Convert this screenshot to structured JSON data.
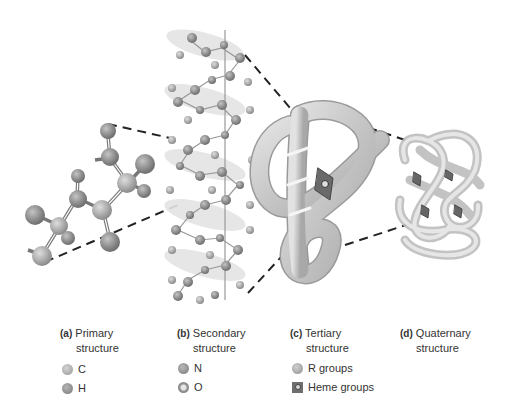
{
  "figure": {
    "panels": [
      {
        "id": "a",
        "tag": "(a)",
        "line1": "Primary",
        "line2": "structure"
      },
      {
        "id": "b",
        "tag": "(b)",
        "line1": "Secondary",
        "line2": "structure"
      },
      {
        "id": "c",
        "tag": "(c)",
        "line1": "Tertiary",
        "line2": "structure"
      },
      {
        "id": "d",
        "tag": "(d)",
        "line1": "Quaternary",
        "line2": "structure"
      }
    ],
    "legend": {
      "primary": [
        {
          "symbol": "gray-sphere-light",
          "label": "C"
        },
        {
          "symbol": "gray-sphere-dark",
          "label": "H"
        }
      ],
      "secondary": [
        {
          "symbol": "gray-sphere-medium",
          "label": "N"
        },
        {
          "symbol": "ringed-sphere",
          "label": "O"
        }
      ],
      "tertiary": [
        {
          "symbol": "gray-sphere-light",
          "label": "R groups"
        },
        {
          "symbol": "heme-square",
          "label": "Heme groups"
        }
      ]
    },
    "colors": {
      "background": "#ffffff",
      "atom_light": "#b0b0b0",
      "atom_dark": "#8a8a8a",
      "tube": "#c8c8c8",
      "dash_line": "#222222",
      "text": "#333333"
    }
  }
}
